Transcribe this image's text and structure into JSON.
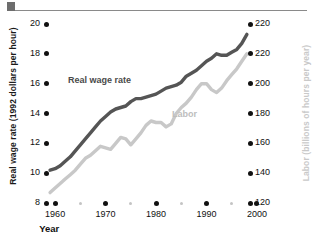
{
  "figure": {
    "ornament": "top-rule"
  },
  "chart_data": {
    "type": "line",
    "title": "",
    "xlabel": "Year",
    "ylabel": "Real wage rate (1992 dollars per hour)",
    "y2label": "Labor (billions of hours per year)",
    "grid": false,
    "legend_position": "inline-annotations",
    "xlim": [
      1957,
      2001
    ],
    "ylim": [
      8,
      20
    ],
    "y2lim": [
      120,
      240
    ],
    "xticks": [
      1960,
      1970,
      1980,
      1990,
      2000
    ],
    "xtick_labels": [
      "1960",
      "1970",
      "1980",
      "1990",
      "2000"
    ],
    "xminor_ticks": [
      1965,
      1975,
      1985,
      1995
    ],
    "yticks": [
      8,
      10,
      12,
      14,
      16,
      18,
      20
    ],
    "ytick_labels": [
      "8",
      "10",
      "12",
      "14",
      "16",
      "18",
      "20"
    ],
    "y2ticks": [
      120,
      140,
      160,
      180,
      200,
      220,
      220
    ],
    "y2tick_labels": [
      "120",
      "140",
      "160",
      "180",
      "200",
      "220",
      "220"
    ],
    "series": [
      {
        "name": "Real wage rate",
        "color": "#555555",
        "axis": "left",
        "units": "1992 dollars per hour",
        "x": [
          1959,
          1960,
          1961,
          1962,
          1963,
          1964,
          1965,
          1966,
          1967,
          1968,
          1969,
          1970,
          1971,
          1972,
          1973,
          1974,
          1975,
          1976,
          1977,
          1978,
          1979,
          1980,
          1981,
          1982,
          1983,
          1984,
          1985,
          1986,
          1987,
          1988,
          1989,
          1990,
          1991,
          1992,
          1993,
          1994,
          1995,
          1996,
          1997,
          1998
        ],
        "values": [
          10.2,
          10.3,
          10.5,
          10.8,
          11.1,
          11.5,
          11.9,
          12.3,
          12.7,
          13.1,
          13.5,
          13.8,
          14.1,
          14.3,
          14.4,
          14.5,
          14.8,
          15.0,
          15.0,
          15.1,
          15.2,
          15.3,
          15.5,
          15.7,
          15.8,
          15.9,
          16.1,
          16.5,
          16.7,
          16.9,
          17.2,
          17.5,
          17.7,
          18.0,
          17.9,
          17.9,
          18.1,
          18.3,
          18.7,
          19.3
        ]
      },
      {
        "name": "Labor",
        "color": "#c8c8c8",
        "axis": "right",
        "units": "billions of hours per year",
        "x": [
          1959,
          1960,
          1961,
          1962,
          1963,
          1964,
          1965,
          1966,
          1967,
          1968,
          1969,
          1970,
          1971,
          1972,
          1973,
          1974,
          1975,
          1976,
          1977,
          1978,
          1979,
          1980,
          1981,
          1982,
          1983,
          1984,
          1985,
          1986,
          1987,
          1988,
          1989,
          1990,
          1991,
          1992,
          1993,
          1994,
          1995,
          1996,
          1997,
          1998
        ],
        "values": [
          127,
          130,
          133,
          136,
          139,
          142,
          146,
          150,
          152,
          155,
          158,
          157,
          156,
          160,
          164,
          163,
          159,
          163,
          167,
          172,
          175,
          174,
          174,
          171,
          173,
          180,
          184,
          187,
          191,
          196,
          200,
          200,
          196,
          194,
          197,
          202,
          206,
          210,
          215,
          220
        ]
      }
    ],
    "annotations": [
      {
        "text": "Real wage rate",
        "series": "Real wage rate"
      },
      {
        "text": "Labor",
        "series": "Labor"
      }
    ]
  }
}
